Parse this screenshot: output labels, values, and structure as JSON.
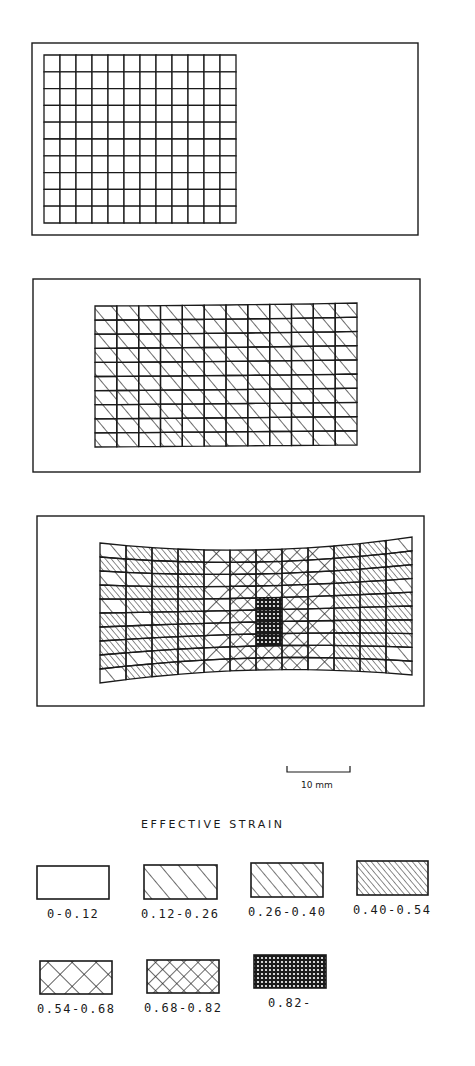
{
  "figure": {
    "panels": [
      {
        "id": "undeformed",
        "frame": [
          32,
          43,
          418,
          235
        ],
        "cols": 12,
        "rows": 10,
        "mesh": {
          "x0": 44,
          "x1": 236,
          "top": [
            55,
            55,
            55
          ],
          "bottom": [
            223,
            223,
            223
          ]
        },
        "default_pattern": "p0",
        "cells": []
      },
      {
        "id": "stage-1",
        "frame": [
          33,
          279,
          420,
          472
        ],
        "cols": 12,
        "rows": 10,
        "mesh": {
          "x0": 95,
          "x1": 357,
          "top": [
            306,
            305,
            303
          ],
          "bottom": [
            447,
            446,
            445
          ]
        },
        "default_pattern": "p1",
        "cells": [
          {
            "c": 1,
            "r": 6,
            "p": "p2"
          },
          {
            "c": 3,
            "r": 8,
            "p": "p2"
          },
          {
            "c": 3,
            "r": 9,
            "p": "p2"
          }
        ]
      },
      {
        "id": "stage-2",
        "frame": [
          37,
          516,
          424,
          706
        ],
        "cols": 12,
        "rows": 10,
        "mesh": {
          "x0": 100,
          "x1": 412,
          "top": [
            543,
            550,
            537
          ],
          "bottom": [
            683,
            670,
            675
          ]
        },
        "default_pattern": "p3",
        "columns": [
          "mix-a",
          "p3",
          "p3",
          "p3",
          "p4",
          "p5",
          "p5",
          "p5",
          "p4",
          "p3",
          "p3",
          "mix-b"
        ],
        "cells": [
          {
            "c": 0,
            "r": 0,
            "p": "p1"
          },
          {
            "c": 0,
            "r": 1,
            "p": "p3"
          },
          {
            "c": 0,
            "r": 2,
            "p": "p1"
          },
          {
            "c": 0,
            "r": 3,
            "p": "p3"
          },
          {
            "c": 0,
            "r": 4,
            "p": "p1"
          },
          {
            "c": 0,
            "r": 5,
            "p": "p3"
          },
          {
            "c": 0,
            "r": 6,
            "p": "p3"
          },
          {
            "c": 0,
            "r": 7,
            "p": "p3"
          },
          {
            "c": 0,
            "r": 8,
            "p": "p3"
          },
          {
            "c": 0,
            "r": 9,
            "p": "p1"
          },
          {
            "c": 1,
            "r": 2,
            "p": "p2"
          },
          {
            "c": 1,
            "r": 5,
            "p": "p1"
          },
          {
            "c": 1,
            "r": 8,
            "p": "p1"
          },
          {
            "c": 3,
            "r": 9,
            "p": "p4"
          },
          {
            "c": 6,
            "r": 4,
            "p": "p6"
          },
          {
            "c": 6,
            "r": 5,
            "p": "p6"
          },
          {
            "c": 6,
            "r": 6,
            "p": "p6"
          },
          {
            "c": 6,
            "r": 7,
            "p": "p6"
          },
          {
            "c": 11,
            "r": 0,
            "p": "p1"
          },
          {
            "c": 11,
            "r": 1,
            "p": "p3"
          },
          {
            "c": 11,
            "r": 2,
            "p": "p3"
          },
          {
            "c": 11,
            "r": 3,
            "p": "p2"
          },
          {
            "c": 11,
            "r": 4,
            "p": "p3"
          },
          {
            "c": 11,
            "r": 5,
            "p": "p3"
          },
          {
            "c": 11,
            "r": 6,
            "p": "p3"
          },
          {
            "c": 11,
            "r": 7,
            "p": "p3"
          },
          {
            "c": 11,
            "r": 8,
            "p": "p1"
          },
          {
            "c": 11,
            "r": 9,
            "p": "p2"
          }
        ]
      }
    ],
    "scale_bar": {
      "x0": 287,
      "x1": 350,
      "y": 772,
      "label": "10 mm"
    },
    "legend": {
      "title": "EFFECTIVE  STRAIN",
      "items": [
        {
          "pattern": "p0",
          "label": "0-0.12",
          "box": [
            37,
            866,
            72,
            33
          ]
        },
        {
          "pattern": "p1",
          "label": "0.12-0.26",
          "box": [
            144,
            865,
            73,
            34
          ]
        },
        {
          "pattern": "p2",
          "label": "0.26-0.40",
          "box": [
            251,
            863,
            72,
            34
          ]
        },
        {
          "pattern": "p3",
          "label": "0.40-0.54",
          "box": [
            357,
            861,
            71,
            34
          ]
        },
        {
          "pattern": "p4",
          "label": "0.54-0.68",
          "box": [
            40,
            961,
            72,
            33
          ]
        },
        {
          "pattern": "p5",
          "label": "0.68-0.82",
          "box": [
            147,
            960,
            72,
            33
          ]
        },
        {
          "pattern": "p6",
          "label": "0.82-",
          "box": [
            254,
            955,
            72,
            33
          ]
        }
      ]
    }
  },
  "chart_data": {
    "type": "diagram",
    "legend_title": "EFFECTIVE STRAIN",
    "strain_ranges": [
      "0-0.12",
      "0.12-0.26",
      "0.26-0.40",
      "0.40-0.54",
      "0.54-0.68",
      "0.68-0.82",
      "0.82-"
    ],
    "scale": "10 mm",
    "panels": [
      {
        "stage": 1,
        "mesh": "12x10 undeformed",
        "dominant_range": "0-0.12"
      },
      {
        "stage": 2,
        "mesh": "12x10 uniformly stretched",
        "dominant_range": "0.12-0.26",
        "local": "0.26-0.40 in 3 cells"
      },
      {
        "stage": 3,
        "mesh": "12x10 necked",
        "ends": "0.12-0.54",
        "neck_region": "0.54-0.82",
        "center": "0.82-"
      }
    ]
  }
}
